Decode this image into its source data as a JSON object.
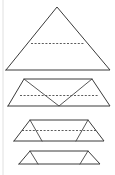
{
  "figure": {
    "background_color": "#ffffff",
    "stroke_color": "#3a3a3a",
    "fold_line_color": "#4a4a4a",
    "margin_rule_color": "#d8d8d8",
    "stage_count": 4,
    "stages": [
      {
        "name": "stage-1-triangle",
        "label": "Unfolded triangle with midline",
        "outline": "6,70 57,7 110,70",
        "fold_lines": [
          "31,43 84,43"
        ],
        "creases": []
      },
      {
        "name": "stage-2-partial-fold",
        "label": "Triangle folded once, zigzag creases",
        "outline": "8,106 24,79 92,79 110,106",
        "fold_lines": [
          "20,95 98,95"
        ],
        "creases": [
          "24,79 59,106 92,79"
        ]
      },
      {
        "name": "stage-3-further-fold",
        "label": "Triangle folded twice, flattened trapezoid",
        "outline": "14,141 30,120 88,120 104,141",
        "fold_lines": [
          "22,130 96,130"
        ],
        "creases": [
          "30,120 42,141",
          "88,120 76,141"
        ]
      },
      {
        "name": "stage-4-flat",
        "label": "Fully folded flat trapezoid",
        "outline": "19,164 30,151 88,151 100,164",
        "fold_lines": [],
        "creases": [
          "30,151 38,164",
          "88,151 80,164"
        ]
      }
    ],
    "margin_rule": "3,0 3,175"
  }
}
